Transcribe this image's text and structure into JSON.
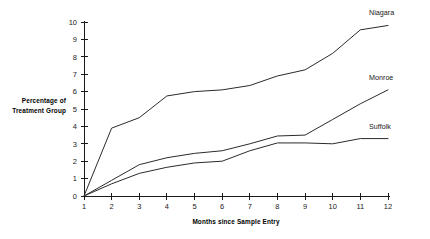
{
  "chart_data": {
    "type": "line",
    "title": "",
    "subtitle": "",
    "xlabel": "Months since Sample Entry",
    "ylabel": "Percentage of Treatment Group",
    "ylabel_line1": "Percentage of",
    "ylabel_line2": "Treatment Group",
    "x": [
      1,
      2,
      3,
      4,
      5,
      6,
      7,
      8,
      9,
      10,
      11,
      12
    ],
    "xlim": [
      1,
      12
    ],
    "ylim": [
      0,
      10
    ],
    "xticks": [
      "1",
      "2",
      "3",
      "4",
      "5",
      "6",
      "7",
      "8",
      "9",
      "10",
      "11",
      "12"
    ],
    "yticks": [
      "0",
      "1",
      "2",
      "3",
      "4",
      "5",
      "6",
      "7",
      "8",
      "9",
      "10"
    ],
    "grid": false,
    "legend_position": "right-of-line-end",
    "series": [
      {
        "name": "Niagara",
        "values": [
          0,
          3.9,
          4.5,
          5.75,
          6.0,
          6.1,
          6.35,
          6.9,
          7.25,
          8.2,
          9.55,
          9.8
        ],
        "color": "#2b2b2b"
      },
      {
        "name": "Monroe",
        "values": [
          0,
          0.9,
          1.8,
          2.2,
          2.45,
          2.6,
          3.0,
          3.45,
          3.5,
          4.4,
          5.3,
          6.1
        ],
        "color": "#2b2b2b"
      },
      {
        "name": "Suffolk",
        "values": [
          0,
          0.7,
          1.3,
          1.65,
          1.9,
          2.0,
          2.6,
          3.05,
          3.05,
          3.0,
          3.3,
          3.3
        ],
        "color": "#2b2b2b"
      }
    ]
  },
  "colors": {
    "background": "#ffffff",
    "axis": "#1a1a1a",
    "line": "#2b2b2b",
    "text": "#000000"
  }
}
